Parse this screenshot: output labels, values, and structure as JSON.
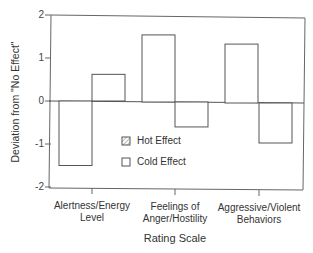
{
  "chart_data": {
    "type": "bar",
    "title": "",
    "xlabel": "Rating Scale",
    "ylabel": "Deviation from \"No Effect\"",
    "ylim": [
      -2,
      2
    ],
    "yticks": [
      "2",
      "1",
      "0",
      "-1",
      "-2"
    ],
    "grid": false,
    "legend_position": "inside-center",
    "categories": [
      "Alertness/Energy Level",
      "Feelings of Anger/Hostility",
      "Aggressive/Violent Behaviors"
    ],
    "category_lines": [
      [
        "Alertness/Energy",
        "Level"
      ],
      [
        "Feelings of",
        "Anger/Hostility"
      ],
      [
        "Aggressive/Violent",
        "Behaviors"
      ]
    ],
    "series": [
      {
        "name": "Hot Effect",
        "values": [
          -1.5,
          1.56,
          1.37
        ]
      },
      {
        "name": "Cold Effect",
        "values": [
          0.62,
          -0.58,
          -0.93
        ]
      }
    ],
    "legend": [
      "Hot Effect",
      "Cold Effect"
    ]
  }
}
